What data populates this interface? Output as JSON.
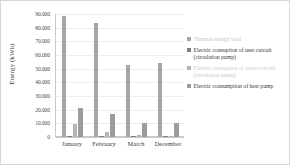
{
  "chart_data": {
    "type": "bar",
    "title": "",
    "xlabel": "",
    "ylabel": "Energy (kWh)",
    "categories": [
      "January",
      "February",
      "March",
      "December"
    ],
    "ylim": [
      0,
      90000
    ],
    "ytick_labels": [
      "90.000",
      "80.000",
      "70.000",
      "60.000",
      "50.000",
      "40.000",
      "30.000",
      "20.000",
      "10.000",
      "0"
    ],
    "ytick_values": [
      90000,
      80000,
      70000,
      60000,
      50000,
      40000,
      30000,
      20000,
      10000,
      0
    ],
    "grid": true,
    "legend_position": "right",
    "series": [
      {
        "name": "Thermal energy load",
        "color": "#a6a6a6",
        "text_color": "#c8c8c8",
        "values": [
          88500,
          83500,
          52500,
          54000
        ]
      },
      {
        "name": "Electric consuption of user curcuit (circulation pump)",
        "color": "#808080",
        "text_color": "#3b3b3b",
        "values": [
          900,
          850,
          550,
          600
        ]
      },
      {
        "name": "Electric consuption of source circuit (circulation pump)",
        "color": "#b5b5b5",
        "text_color": "#cdcdcd",
        "values": [
          9500,
          4000,
          1800,
          900
        ]
      },
      {
        "name": "Electric consumption of heat pump",
        "color": "#9c9c9c",
        "text_color": "#3b3b3b",
        "values": [
          21000,
          17000,
          10000,
          10500
        ]
      }
    ]
  }
}
